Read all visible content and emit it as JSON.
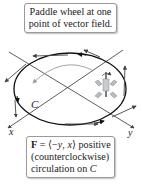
{
  "top_callout": {
    "line1": "Paddle wheel at one",
    "line2": "point of vector field."
  },
  "bottom_callout": {
    "field_symbol": "F",
    "field_eq": " = ⟨−",
    "y_var": "y",
    "comma": ", ",
    "x_var": "x",
    "field_tail": "⟩ positive",
    "line2": "(counterclockwise)",
    "line3_prefix": "circulation on ",
    "curve_var": "C"
  },
  "labels": {
    "curve": "C",
    "x_axis": "x",
    "y_axis": "y"
  },
  "colors": {
    "curve": "#111111",
    "axes": "#333333",
    "vectors": "#444444",
    "paddle_blades": "#9aa0a6",
    "rotation_arrow": "#888888"
  },
  "icons": [
    "paddle-wheel-icon",
    "rotation-arrow-icon"
  ]
}
